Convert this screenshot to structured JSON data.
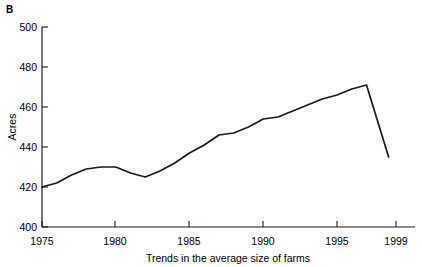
{
  "figure": {
    "panel_label": "B"
  },
  "chart_data": {
    "type": "line",
    "title": "",
    "xlabel": "Trends in the average size of farms",
    "ylabel": "Acres",
    "xlim": [
      1975,
      1999.8
    ],
    "ylim": [
      400,
      500
    ],
    "grid": false,
    "legend": null,
    "xticks": [
      1975,
      1980,
      1985,
      1990,
      1995,
      1999
    ],
    "xtick_labels": [
      "1975",
      "1980",
      "1985",
      "1990",
      "1995",
      "1999"
    ],
    "yticks": [
      400,
      420,
      440,
      460,
      480,
      500
    ],
    "ytick_labels": [
      "400",
      "420",
      "440",
      "460",
      "480",
      "500"
    ],
    "series": [
      {
        "name": "Average farm size",
        "x": [
          1975,
          1976,
          1977,
          1978,
          1979,
          1980,
          1981,
          1982,
          1983,
          1984,
          1985,
          1986,
          1987,
          1988,
          1989,
          1990,
          1991,
          1992,
          1993,
          1994,
          1995,
          1996,
          1997,
          1998.5
        ],
        "values": [
          420,
          422,
          426,
          429,
          430,
          430,
          427,
          425,
          428,
          432,
          437,
          441,
          446,
          447,
          450,
          454,
          455,
          458,
          461,
          464,
          466,
          469,
          471,
          435
        ]
      }
    ]
  }
}
